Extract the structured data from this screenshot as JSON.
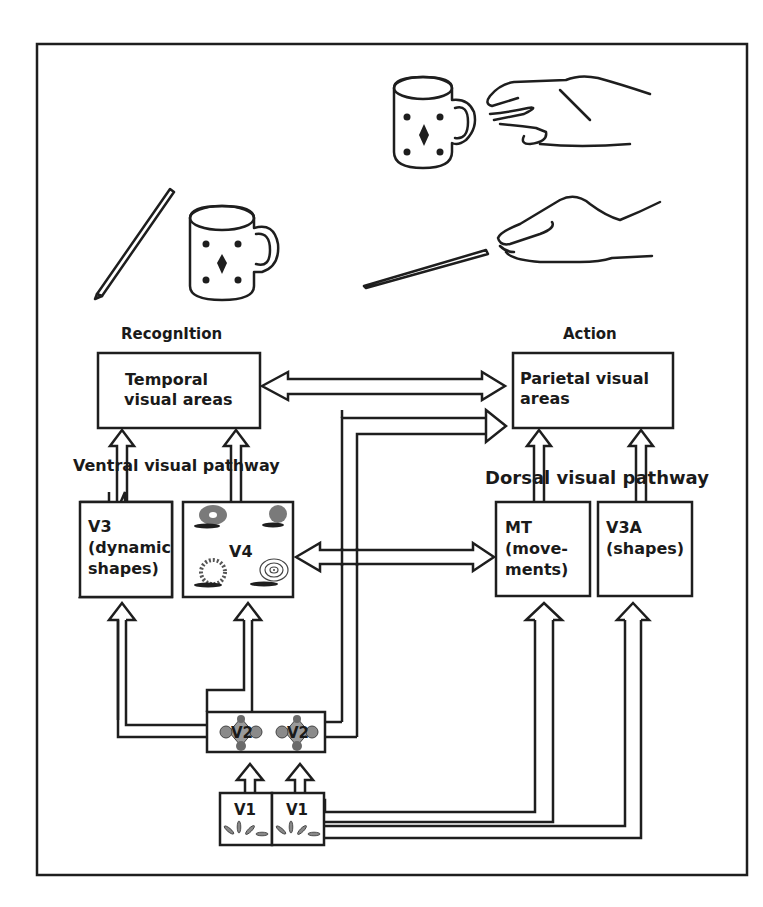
{
  "figure": {
    "colors": {
      "stroke": "#1e1e1e",
      "background": "#ffffff",
      "v2_fill": "#9a9a9a",
      "v4_texture": "#777777"
    }
  },
  "sections": {
    "recognition": {
      "label": "Recognition",
      "rendered_label": "RecognItion"
    },
    "action": {
      "label": "Action"
    }
  },
  "areas": {
    "temporal": {
      "line1": "Temporal",
      "line2": "visual areas"
    },
    "parietal": {
      "line1": "Parietal visual",
      "line2": "areas"
    },
    "v3": {
      "line1": "V3",
      "line2": "(dynamic",
      "line3": "shapes)"
    },
    "v4": {
      "label": "V4"
    },
    "mt": {
      "line1": "MT",
      "line2": "(move-",
      "line3": "ments)"
    },
    "v3a": {
      "line1": "V3A",
      "line2": "(shapes)"
    },
    "v2": {
      "left": "V2",
      "right": "V2"
    },
    "v1": {
      "left": "V1",
      "right": "V1"
    }
  },
  "pathways": {
    "ventral": "Ventral visual pathway",
    "dorsal": "Dorsal visual pathway"
  },
  "illustrations": {
    "recognition_scene": [
      "pencil-icon",
      "mug-icon"
    ],
    "action_scene": [
      "mug-icon",
      "reaching-hand-icon",
      "pencil-icon",
      "grasping-hand-icon"
    ]
  },
  "connections": [
    {
      "from": "temporal",
      "to": "parietal",
      "type": "bidirectional"
    },
    {
      "from": "v4",
      "to": "mt",
      "type": "bidirectional"
    },
    {
      "from": "v2",
      "to": "parietal",
      "type": "unidirectional"
    },
    {
      "from": "v3",
      "to": "temporal",
      "type": "unidirectional"
    },
    {
      "from": "v4",
      "to": "temporal",
      "type": "unidirectional"
    },
    {
      "from": "mt",
      "to": "parietal",
      "type": "unidirectional"
    },
    {
      "from": "v3a",
      "to": "parietal",
      "type": "unidirectional"
    },
    {
      "from": "v2",
      "to": "v3",
      "type": "unidirectional"
    },
    {
      "from": "v2",
      "to": "v4",
      "type": "unidirectional"
    },
    {
      "from": "v1",
      "to": "v2",
      "type": "unidirectional"
    },
    {
      "from": "v1",
      "to": "mt",
      "type": "unidirectional"
    },
    {
      "from": "v1",
      "to": "v3a",
      "type": "unidirectional"
    }
  ]
}
